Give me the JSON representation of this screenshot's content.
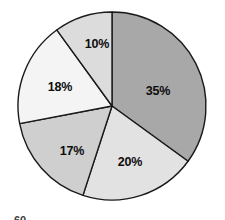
{
  "figure": {
    "name": "pie-chart-figure",
    "background_color": "#ffffff",
    "outline_color": "#1a1a1a"
  },
  "footer": {
    "page_number": "60"
  },
  "chart_data": {
    "type": "pie",
    "title": "",
    "subtitle": "",
    "xlabel": "",
    "ylabel": "",
    "grid": false,
    "legend": "none",
    "start_angle_deg": 0,
    "direction": "clockwise",
    "center": {
      "x": 112,
      "y": 106
    },
    "radius": 94,
    "labels": [
      "35%",
      "20%",
      "17%",
      "18%",
      "10%"
    ],
    "values": [
      35,
      20,
      17,
      18,
      10
    ],
    "categories": [
      "35%",
      "20%",
      "17%",
      "18%",
      "10%"
    ],
    "colors": [
      "#a8a8a8",
      "#e2e2e2",
      "#cfcfcf",
      "#f4f4f4",
      "#dcdcdc"
    ],
    "slices": [
      {
        "label": "35%",
        "value": 35,
        "color": "#a8a8a8",
        "start_deg": 0,
        "end_deg": 126,
        "label_x": 158,
        "label_y": 92
      },
      {
        "label": "20%",
        "value": 20,
        "color": "#e2e2e2",
        "start_deg": 126,
        "end_deg": 198,
        "label_x": 130,
        "label_y": 163
      },
      {
        "label": "17%",
        "value": 17,
        "color": "#cfcfcf",
        "start_deg": 198,
        "end_deg": 259.2,
        "label_x": 72,
        "label_y": 152
      },
      {
        "label": "18%",
        "value": 18,
        "color": "#f4f4f4",
        "start_deg": 259.2,
        "end_deg": 324,
        "label_x": 60,
        "label_y": 88
      },
      {
        "label": "10%",
        "value": 10,
        "color": "#dcdcdc",
        "start_deg": 324,
        "end_deg": 360,
        "label_x": 97,
        "label_y": 45
      }
    ]
  }
}
